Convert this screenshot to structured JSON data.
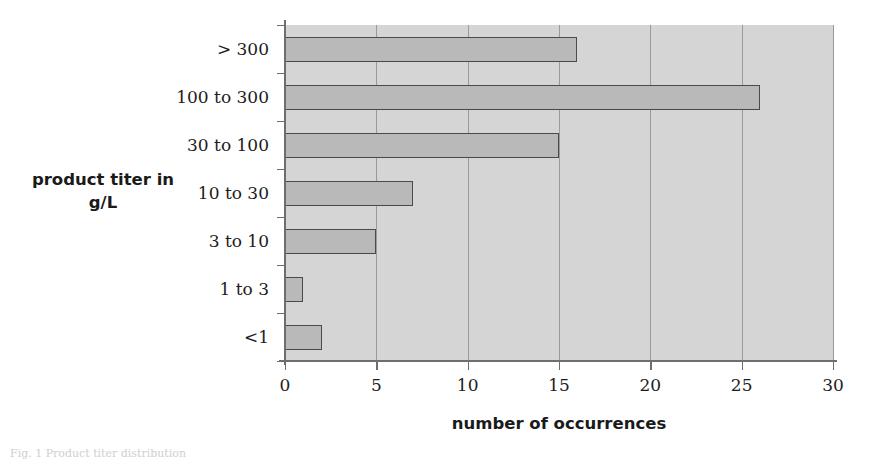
{
  "chart_data": {
    "type": "bar",
    "orientation": "horizontal",
    "title": "",
    "xlabel": "number of occurrences",
    "ylabel": "product titer in\ng/L",
    "categories": [
      "> 300",
      "100 to 300",
      "30 to 100",
      "10 to 30",
      "3 to 10",
      "1 to 3",
      "<1"
    ],
    "values": [
      16,
      26,
      15,
      7,
      5,
      1,
      2
    ],
    "xlim": [
      0,
      30
    ],
    "xticks": [
      0,
      5,
      10,
      15,
      20,
      25,
      30
    ],
    "xtick_labels": [
      "0",
      "5",
      "10",
      "15",
      "20",
      "25",
      "30"
    ],
    "grid": "vertical gridlines at each x tick",
    "legend": "none",
    "colors": {
      "bar_fill": "#b9b9b9",
      "bar_border": "#4a4a4a",
      "plot_background": "#d5d5d5",
      "gridline": "#9a9a9a",
      "axis_line": "#6e6e6e",
      "text": "#1d1d1d",
      "page_background": "#ffffff"
    }
  },
  "caption": {
    "text": "Fig. 1 Product titer distribution"
  }
}
